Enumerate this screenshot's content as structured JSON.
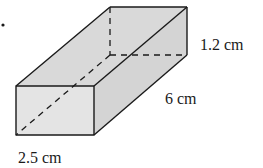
{
  "diagram": {
    "type": "rectangular-prism",
    "bullet": "•",
    "labels": {
      "height": "1.2 cm",
      "length": "6 cm",
      "width": "2.5 cm"
    },
    "colors": {
      "face_fill": "#dcdcdc",
      "front_face_fill": "#e6e6e6",
      "edge": "#1a1a1a"
    }
  }
}
